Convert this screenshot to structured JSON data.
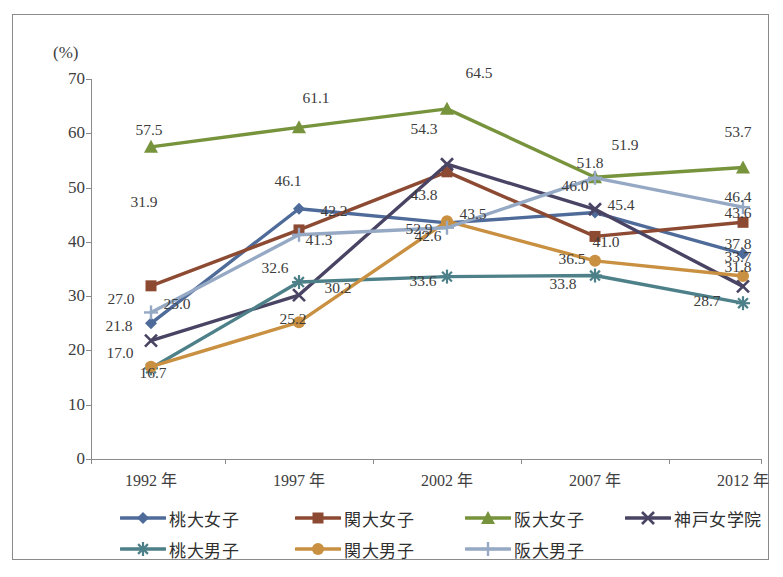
{
  "axis": {
    "unit_label": "(%)",
    "y_ticks": [
      70,
      60,
      50,
      40,
      30,
      20,
      10,
      0
    ],
    "x_categories": [
      "1992 年",
      "1997 年",
      "2002 年",
      "2007 年",
      "2012 年"
    ]
  },
  "legend": {
    "items": [
      {
        "label": "桃大女子",
        "color": "#4F6B99",
        "marker": "diamond"
      },
      {
        "label": "関大女子",
        "color": "#8D4A33",
        "marker": "square"
      },
      {
        "label": "阪大女子",
        "color": "#77933C",
        "marker": "triangle"
      },
      {
        "label": "神戸女学院",
        "color": "#4A4464",
        "marker": "x"
      },
      {
        "label": "桃大男子",
        "color": "#4D8088",
        "marker": "asterisk"
      },
      {
        "label": "関大男子",
        "color": "#C89040",
        "marker": "circle"
      },
      {
        "label": "阪大男子",
        "color": "#96A9C4",
        "marker": "plus"
      }
    ]
  },
  "chart_data": {
    "type": "line",
    "title": "",
    "xlabel": "",
    "ylabel": "(%)",
    "ylim": [
      0,
      70
    ],
    "ytick_step": 10,
    "grid": false,
    "legend_position": "bottom",
    "categories": [
      "1992 年",
      "1997 年",
      "2002 年",
      "2007 年",
      "2012 年"
    ],
    "series": [
      {
        "name": "桃大女子",
        "color": "#4F6B99",
        "marker": "diamond",
        "values": [
          25.0,
          46.1,
          43.5,
          45.4,
          37.8
        ]
      },
      {
        "name": "関大女子",
        "color": "#8D4A33",
        "marker": "square",
        "values": [
          31.9,
          42.2,
          52.9,
          41.0,
          43.6
        ]
      },
      {
        "name": "阪大女子",
        "color": "#77933C",
        "marker": "triangle",
        "values": [
          57.5,
          61.1,
          64.5,
          51.9,
          53.7
        ]
      },
      {
        "name": "神戸女学院",
        "color": "#4A4464",
        "marker": "x",
        "values": [
          21.8,
          30.2,
          54.3,
          46.0,
          31.8
        ]
      },
      {
        "name": "桃大男子",
        "color": "#4D8088",
        "marker": "asterisk",
        "values": [
          16.7,
          32.6,
          33.6,
          33.8,
          28.7
        ]
      },
      {
        "name": "関大男子",
        "color": "#C89040",
        "marker": "circle",
        "values": [
          17.0,
          25.2,
          43.8,
          36.5,
          33.7
        ]
      },
      {
        "name": "阪大男子",
        "color": "#96A9C4",
        "marker": "plus",
        "values": [
          27.0,
          41.3,
          42.6,
          51.8,
          46.4
        ]
      }
    ],
    "data_labels": [
      {
        "text": "57.5",
        "x": 148,
        "y": 129
      },
      {
        "text": "61.1",
        "x": 315,
        "y": 97
      },
      {
        "text": "64.5",
        "x": 478,
        "y": 72
      },
      {
        "text": "51.9",
        "x": 624,
        "y": 144
      },
      {
        "text": "53.7",
        "x": 737,
        "y": 131
      },
      {
        "text": "31.9",
        "x": 143,
        "y": 201
      },
      {
        "text": "42.2",
        "x": 333,
        "y": 210
      },
      {
        "text": "52.9",
        "x": 418,
        "y": 228
      },
      {
        "text": "41.0",
        "x": 605,
        "y": 241
      },
      {
        "text": "43.6",
        "x": 737,
        "y": 212
      },
      {
        "text": "27.0",
        "x": 120,
        "y": 298
      },
      {
        "text": "41.3",
        "x": 318,
        "y": 239
      },
      {
        "text": "42.6",
        "x": 427,
        "y": 235
      },
      {
        "text": "51.8",
        "x": 589,
        "y": 162
      },
      {
        "text": "46.4",
        "x": 737,
        "y": 196
      },
      {
        "text": "25.0",
        "x": 176,
        "y": 303
      },
      {
        "text": "46.1",
        "x": 287,
        "y": 180
      },
      {
        "text": "43.5",
        "x": 472,
        "y": 213
      },
      {
        "text": "45.4",
        "x": 620,
        "y": 204
      },
      {
        "text": "37.8",
        "x": 737,
        "y": 243
      },
      {
        "text": "21.8",
        "x": 118,
        "y": 325
      },
      {
        "text": "30.2",
        "x": 337,
        "y": 287
      },
      {
        "text": "54.3",
        "x": 423,
        "y": 128
      },
      {
        "text": "46.0",
        "x": 574,
        "y": 185
      },
      {
        "text": "31.8",
        "x": 737,
        "y": 266
      },
      {
        "text": "17.0",
        "x": 119,
        "y": 352
      },
      {
        "text": "25.2",
        "x": 292,
        "y": 318
      },
      {
        "text": "43.8",
        "x": 423,
        "y": 194
      },
      {
        "text": "36.5",
        "x": 571,
        "y": 258
      },
      {
        "text": "33.7",
        "x": 737,
        "y": 256
      },
      {
        "text": "16.7",
        "x": 152,
        "y": 372
      },
      {
        "text": "32.6",
        "x": 274,
        "y": 267
      },
      {
        "text": "33.6",
        "x": 422,
        "y": 280
      },
      {
        "text": "33.8",
        "x": 562,
        "y": 283
      },
      {
        "text": "28.7",
        "x": 706,
        "y": 300
      }
    ]
  }
}
